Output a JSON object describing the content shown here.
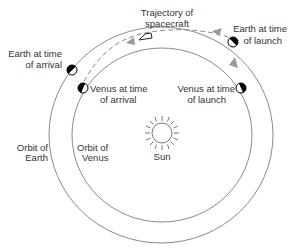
{
  "diagram": {
    "labels": {
      "trajectory_line1": "Trajectory of",
      "trajectory_line2": "spacecraft",
      "earth_launch_line1": "Earth at time",
      "earth_launch_line2": "of launch",
      "earth_arrival_line1": "Earth at time",
      "earth_arrival_line2": "of arrival",
      "venus_arrival_line1": "Venus at time",
      "venus_arrival_line2": "of arrival",
      "venus_launch_line1": "Venus at time",
      "venus_launch_line2": "of launch",
      "orbit_earth_line1": "Orbit of",
      "orbit_earth_line2": "Earth",
      "orbit_venus_line1": "Orbit of",
      "orbit_venus_line2": "Venus",
      "sun": "Sun"
    },
    "colors": {
      "orbit": "#8a8a8a",
      "arrow": "#9a9a9a",
      "text": "#333333",
      "planet_dark": "#000000"
    }
  }
}
